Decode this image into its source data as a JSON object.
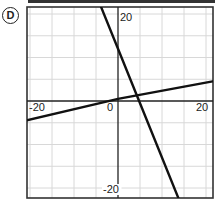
{
  "option": {
    "label": "D"
  },
  "chart_data": {
    "type": "line",
    "title": "",
    "xlabel": "",
    "ylabel": "",
    "xlim": [
      -21,
      21.5
    ],
    "ylim": [
      -22,
      22
    ],
    "grid": true,
    "grid_step": 5,
    "tick_labels": {
      "x": [
        {
          "value": -20,
          "label": "-20"
        },
        {
          "value": 0,
          "label": "0"
        },
        {
          "value": 20,
          "label": "20"
        }
      ],
      "y": [
        {
          "value": 20,
          "label": "20"
        },
        {
          "value": -20,
          "label": "-20"
        }
      ]
    },
    "series": [
      {
        "name": "steep line",
        "equation": "y = -2.5x + 12",
        "slope": -2.5,
        "intercept": 12,
        "points": [
          [
            -4,
            22
          ],
          [
            0,
            12
          ],
          [
            4.8,
            0
          ],
          [
            14,
            -23
          ]
        ]
      },
      {
        "name": "shallow line",
        "equation": "y = 0.2x",
        "slope": 0.2,
        "intercept": 0,
        "points": [
          [
            -21,
            -4.5
          ],
          [
            0,
            0.5
          ],
          [
            21.5,
            4.5
          ]
        ]
      }
    ],
    "intersection": {
      "x": 4.4,
      "y": 1.0
    },
    "legend": null
  },
  "colors": {
    "line": "#111111",
    "grid": "#d8d8d8",
    "axis": "#222222",
    "frame": "#333333"
  }
}
